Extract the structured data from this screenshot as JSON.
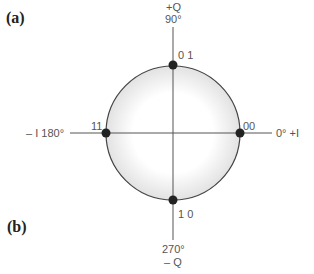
{
  "panels": {
    "a": "(a)",
    "b": "(b)"
  },
  "axes": {
    "top_label": "+Q",
    "top_angle": "90°",
    "bottom_angle": "270°",
    "bottom_label": "– Q",
    "left_label": "– I  180°",
    "right_label": "0°  +I"
  },
  "points": [
    {
      "label": "00",
      "angle_deg": 0
    },
    {
      "label": "0 1",
      "angle_deg": 90
    },
    {
      "label": "11",
      "angle_deg": 180
    },
    {
      "label": "1 0",
      "angle_deg": 270
    }
  ],
  "colors": {
    "line": "#444444",
    "point": "#222222",
    "glow": "#e6e6e6"
  }
}
